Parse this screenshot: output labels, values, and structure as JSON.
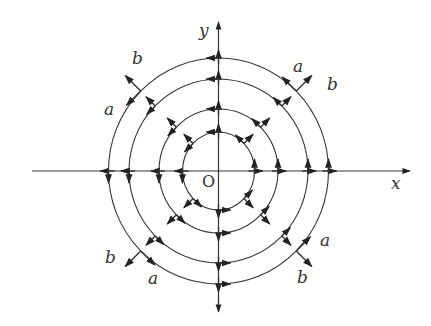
{
  "diagram": {
    "center": {
      "x": 218.5,
      "y": 171
    },
    "axes": {
      "x_label": "x",
      "y_label": "y",
      "origin_label": "O",
      "x_range": [
        32,
        410
      ],
      "y_range": [
        22,
        312
      ]
    },
    "circles": [
      {
        "rx": 36,
        "ry": 39
      },
      {
        "rx": 59.5,
        "ry": 62
      },
      {
        "rx": 89.5,
        "ry": 92
      },
      {
        "rx": 110,
        "ry": 113
      }
    ],
    "rotation_direction": "counterclockwise",
    "radial_direction": "outward",
    "vector_labels": [
      {
        "text": "b",
        "x": 132,
        "y": 50
      },
      {
        "text": "a",
        "x": 104,
        "y": 101
      },
      {
        "text": "a",
        "x": 293,
        "y": 58
      },
      {
        "text": "b",
        "x": 327,
        "y": 76
      },
      {
        "text": "a",
        "x": 320,
        "y": 232
      },
      {
        "text": "b",
        "x": 297,
        "y": 269
      },
      {
        "text": "b",
        "x": 105,
        "y": 249
      },
      {
        "text": "a",
        "x": 148,
        "y": 270
      }
    ],
    "label_positions": {
      "y": {
        "x": 199,
        "y": 22
      },
      "x": {
        "x": 391,
        "y": 175
      },
      "O": {
        "x": 202,
        "y": 174
      }
    },
    "stroke_color": "#333333"
  }
}
